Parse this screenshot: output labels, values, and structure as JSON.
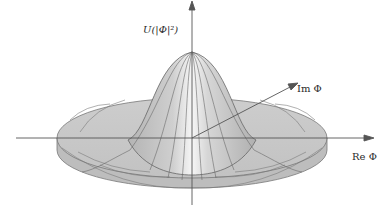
{
  "diagram": {
    "type": "potential-surface",
    "labels": {
      "vertical_axis": "U(|Φ|²)",
      "imaginary_axis": "Im Φ",
      "real_axis": "Re Φ"
    },
    "colors": {
      "surface_fill": "#c9c9c9",
      "surface_highlight": "#f4f4f4",
      "grid_lines": "#6e6e6e",
      "axis": "#555555",
      "background": "#ffffff"
    }
  }
}
